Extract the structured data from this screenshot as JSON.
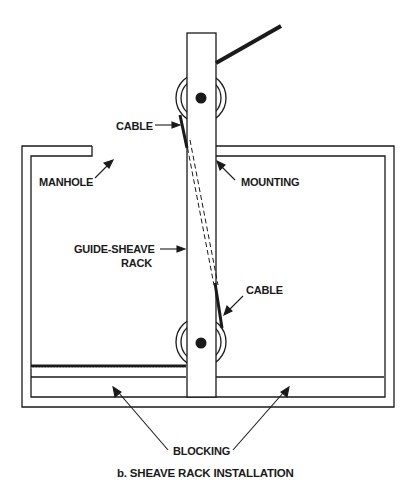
{
  "diagram": {
    "caption": "b. SHEAVE RACK INSTALLATION",
    "labels": {
      "cable_top": "CABLE",
      "manhole": "MANHOLE",
      "mounting": "MOUNTING",
      "guide_sheave_line1": "GUIDE-SHEAVE",
      "guide_sheave_line2": "RACK",
      "cable_bottom": "CABLE",
      "blocking": "BLOCKING"
    },
    "colors": {
      "line": "#1a1a1a",
      "background": "#ffffff"
    },
    "components": [
      "guide-sheave rack",
      "upper sheave",
      "lower sheave",
      "cable",
      "manhole",
      "mounting",
      "blocking"
    ]
  }
}
